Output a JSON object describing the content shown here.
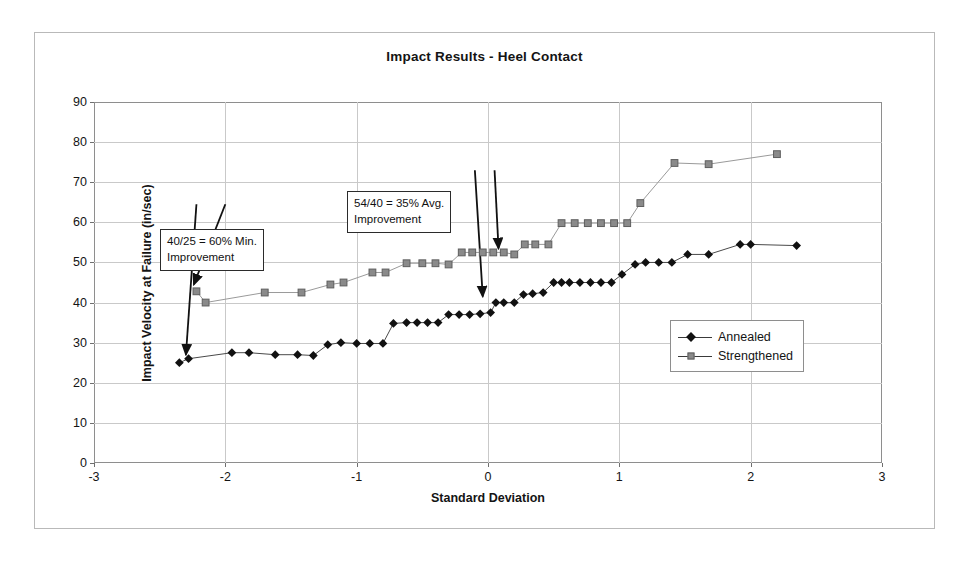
{
  "chart_data": {
    "type": "line",
    "title": "Impact Results - Heel Contact",
    "xlabel": "Standard Deviation",
    "ylabel": "Impact Velocity at Failure (in/sec)",
    "xlim": [
      -3,
      3
    ],
    "ylim": [
      0,
      90
    ],
    "xticks": [
      -3,
      -2,
      -1,
      0,
      1,
      2,
      3
    ],
    "yticks": [
      0,
      10,
      20,
      30,
      40,
      50,
      60,
      70,
      80,
      90
    ],
    "grid": true,
    "legend_position": "center-right",
    "series": [
      {
        "name": "Annealed",
        "marker": "diamond",
        "color": "#111111",
        "points": [
          [
            -2.35,
            25.0
          ],
          [
            -2.28,
            26.0
          ],
          [
            -1.95,
            27.5
          ],
          [
            -1.82,
            27.5
          ],
          [
            -1.62,
            27.0
          ],
          [
            -1.45,
            27.0
          ],
          [
            -1.33,
            26.8
          ],
          [
            -1.22,
            29.5
          ],
          [
            -1.12,
            30.0
          ],
          [
            -1.0,
            29.8
          ],
          [
            -0.9,
            29.8
          ],
          [
            -0.8,
            29.8
          ],
          [
            -0.72,
            34.8
          ],
          [
            -0.62,
            35.0
          ],
          [
            -0.54,
            35.0
          ],
          [
            -0.46,
            35.0
          ],
          [
            -0.38,
            35.0
          ],
          [
            -0.3,
            37.0
          ],
          [
            -0.22,
            37.0
          ],
          [
            -0.14,
            37.0
          ],
          [
            -0.06,
            37.2
          ],
          [
            0.02,
            37.5
          ],
          [
            0.06,
            40.0
          ],
          [
            0.12,
            40.0
          ],
          [
            0.2,
            40.0
          ],
          [
            0.27,
            42.0
          ],
          [
            0.34,
            42.2
          ],
          [
            0.42,
            42.5
          ],
          [
            0.5,
            45.0
          ],
          [
            0.56,
            45.0
          ],
          [
            0.62,
            45.0
          ],
          [
            0.7,
            45.0
          ],
          [
            0.78,
            45.0
          ],
          [
            0.86,
            45.0
          ],
          [
            0.94,
            45.0
          ],
          [
            1.02,
            47.0
          ],
          [
            1.12,
            49.5
          ],
          [
            1.2,
            50.0
          ],
          [
            1.3,
            50.0
          ],
          [
            1.4,
            50.0
          ],
          [
            1.52,
            52.0
          ],
          [
            1.68,
            52.0
          ],
          [
            1.92,
            54.5
          ],
          [
            2.0,
            54.5
          ],
          [
            2.35,
            54.2
          ]
        ]
      },
      {
        "name": "Strengthened",
        "marker": "square",
        "color": "#8a8a8a",
        "points": [
          [
            -2.22,
            42.8
          ],
          [
            -2.15,
            40.0
          ],
          [
            -1.7,
            42.5
          ],
          [
            -1.42,
            42.5
          ],
          [
            -1.2,
            44.5
          ],
          [
            -1.1,
            45.0
          ],
          [
            -0.88,
            47.5
          ],
          [
            -0.78,
            47.5
          ],
          [
            -0.62,
            49.8
          ],
          [
            -0.5,
            49.8
          ],
          [
            -0.4,
            49.8
          ],
          [
            -0.3,
            49.5
          ],
          [
            -0.2,
            52.5
          ],
          [
            -0.12,
            52.5
          ],
          [
            -0.04,
            52.5
          ],
          [
            0.04,
            52.5
          ],
          [
            0.12,
            52.5
          ],
          [
            0.2,
            52.0
          ],
          [
            0.28,
            54.5
          ],
          [
            0.36,
            54.5
          ],
          [
            0.46,
            54.5
          ],
          [
            0.56,
            59.8
          ],
          [
            0.66,
            59.8
          ],
          [
            0.76,
            59.8
          ],
          [
            0.86,
            59.8
          ],
          [
            0.96,
            59.8
          ],
          [
            1.06,
            59.8
          ],
          [
            1.16,
            64.8
          ],
          [
            1.42,
            74.8
          ],
          [
            1.68,
            74.5
          ],
          [
            2.2,
            77.0
          ]
        ]
      }
    ],
    "annotations": [
      {
        "id": "min-improvement",
        "line1": "40/25 = 60% Min.",
        "line2": "Improvement",
        "arrows": [
          {
            "from": [
              -2.22,
              64.5
            ],
            "to": [
              -2.3,
              27.0
            ]
          },
          {
            "from": [
              -2.0,
              64.5
            ],
            "to": [
              -2.24,
              44.5
            ]
          }
        ]
      },
      {
        "id": "avg-improvement",
        "line1": "54/40 = 35% Avg.",
        "line2": "Improvement",
        "arrows": [
          {
            "from": [
              -0.1,
              73.0
            ],
            "to": [
              -0.04,
              41.5
            ]
          },
          {
            "from": [
              0.05,
              73.0
            ],
            "to": [
              0.08,
              53.5
            ]
          }
        ]
      }
    ]
  },
  "legend": {
    "items": [
      {
        "label": "Annealed"
      },
      {
        "label": "Strengthened"
      }
    ]
  }
}
